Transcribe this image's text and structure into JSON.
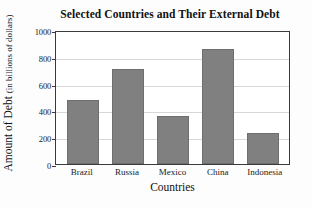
{
  "chart_data": {
    "type": "bar",
    "title": "Selected Countries and Their External Debt",
    "xlabel": "Countries",
    "ylabel": "Amount of Debt",
    "ylabel_unit": "(in billions of dollars)",
    "categories": [
      "Brazil",
      "Russia",
      "Mexico",
      "China",
      "Indonesia"
    ],
    "values": [
      475,
      710,
      355,
      860,
      230
    ],
    "ylim": [
      0,
      1000
    ],
    "yticks": [
      0,
      200,
      400,
      600,
      800,
      1000
    ],
    "ytick_labels": [
      "0",
      "200",
      "400",
      "600",
      "800",
      "1000"
    ],
    "grid": true,
    "legend": null,
    "bar_color": "#808080",
    "bar_edge_color": "#6e6e6e",
    "gridline_color": "#d8d8d8",
    "axis_color": "#3a3a3a",
    "background_color": "#ffffff"
  }
}
